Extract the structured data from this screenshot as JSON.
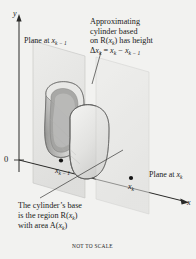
{
  "figure": {
    "caption_note": "NOT TO SCALE",
    "background_color": "#f2f2f0",
    "ink_color": "#1a1a1a"
  },
  "axes": {
    "y_label": "y",
    "x_label": "x",
    "origin_label": "0"
  },
  "ticks": [
    {
      "name": "tick-x-k-minus-1",
      "label_base": "x",
      "label_sub": "k − 1",
      "x": 66,
      "y": 163
    },
    {
      "name": "tick-x-k",
      "label_base": "x",
      "label_sub": "k",
      "x": 136,
      "y": 178
    }
  ],
  "planes": {
    "left_label_text": "Plane at ",
    "left_label_var": "x",
    "left_label_sub": "k − 1",
    "right_label_text": "Plane at ",
    "right_label_var": "x",
    "right_label_sub": "k",
    "fill_color": "#e4e4e2",
    "edge_color": "#b8b8b6"
  },
  "annotations": {
    "top": {
      "line1": "Approximating",
      "line2": "cylinder based",
      "line3_a": "on R(",
      "line3_var": "x",
      "line3_sub": "k",
      "line3_b": ") has height",
      "line4_a": "Δ",
      "line4_var1": "x",
      "line4_sub1": "k",
      "line4_eq": " = ",
      "line4_var2": "x",
      "line4_sub2": "k",
      "line4_minus": " − ",
      "line4_var3": "x",
      "line4_sub3": "k − 1"
    },
    "bottom": {
      "line1": "The cylinder’s base",
      "line2_a": "is the region R(",
      "line2_var": "x",
      "line2_sub": "k",
      "line2_b": ")",
      "line3_a": "with area A(",
      "line3_var": "x",
      "line3_sub": "k",
      "line3_b": ")"
    }
  },
  "solid": {
    "name": "approximating-cylinder",
    "body_light": "#f0f0ee",
    "body_mid": "#c9c9c7",
    "body_dark": "#9e9e9c",
    "outline": "#6f6f6d"
  }
}
